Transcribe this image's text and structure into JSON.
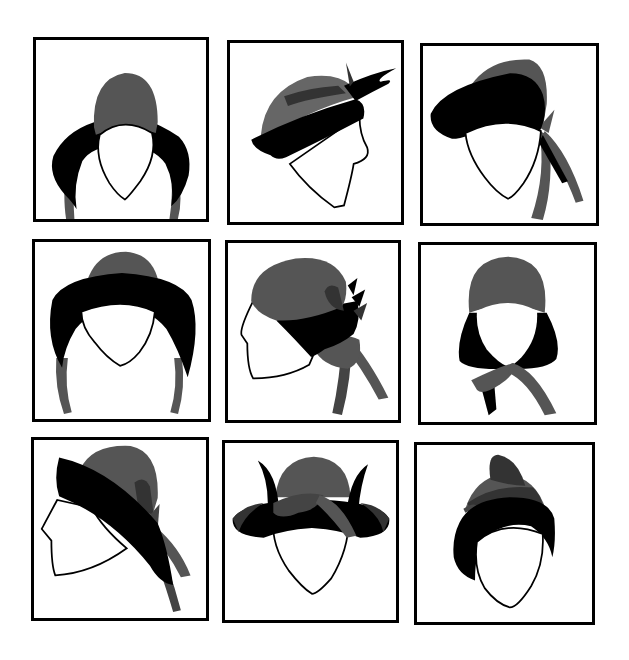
{
  "colors": {
    "background": "#ffffff",
    "frame": "#000000",
    "hat_gray": "#555555",
    "hat_dark_gray": "#333333",
    "hat_black": "#000000",
    "face_fill": "#ffffff",
    "face_outline": "#000000"
  },
  "grid": {
    "rows": 3,
    "columns": 3,
    "panels": [
      {
        "id": 1,
        "style": "bonnet-front-with-ties",
        "view": "front",
        "box": [
          33,
          37,
          176,
          185
        ]
      },
      {
        "id": 2,
        "style": "cloche-with-upturned-brim-and-feather",
        "view": "three-quarter",
        "box": [
          227,
          40,
          177,
          185
        ]
      },
      {
        "id": 3,
        "style": "wide-brim-bonnet-with-side-bow",
        "view": "three-quarter",
        "box": [
          420,
          43,
          179,
          183
        ]
      },
      {
        "id": 4,
        "style": "poke-bonnet-with-ties",
        "view": "front",
        "box": [
          32,
          239,
          179,
          183
        ]
      },
      {
        "id": 5,
        "style": "cloche-with-back-bow",
        "view": "profile",
        "box": [
          225,
          240,
          176,
          183
        ]
      },
      {
        "id": 6,
        "style": "hood-with-neck-bow",
        "view": "front",
        "box": [
          418,
          242,
          179,
          183
        ]
      },
      {
        "id": 7,
        "style": "slanted-brim-hat-with-ribbons",
        "view": "profile",
        "box": [
          31,
          437,
          178,
          184
        ]
      },
      {
        "id": 8,
        "style": "upturned-brim-hat-with-horns-and-sash",
        "view": "front",
        "box": [
          222,
          440,
          177,
          183
        ]
      },
      {
        "id": 9,
        "style": "turban-hat-with-top-bow",
        "view": "front",
        "box": [
          414,
          442,
          181,
          183
        ]
      }
    ]
  }
}
